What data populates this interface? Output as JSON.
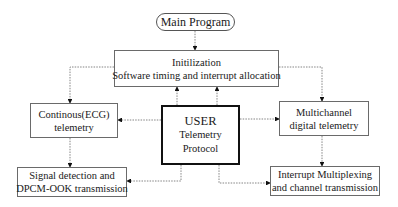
{
  "nodes": {
    "main": {
      "lines": [
        "Main Program"
      ]
    },
    "init": {
      "lines": [
        "Initilization",
        "Software timing and interrupt allocation"
      ]
    },
    "user": {
      "lines": [
        "USER",
        "Telemetry",
        "Protocol"
      ]
    },
    "ecg": {
      "lines": [
        "Continous(ECG)",
        "telemetry"
      ]
    },
    "multi": {
      "lines": [
        "Multichannel",
        "digital telemetry"
      ]
    },
    "signal": {
      "lines": [
        "Signal detection and",
        "DPCM-OOK transmission"
      ]
    },
    "interrupt": {
      "lines": [
        "Interrupt Multiplexing",
        "and channel transmission"
      ]
    }
  },
  "edges": [
    {
      "from": "main",
      "to": "init"
    },
    {
      "from": "init",
      "to": "ecg"
    },
    {
      "from": "init",
      "to": "multi"
    },
    {
      "from": "user",
      "to": "init"
    },
    {
      "from": "user",
      "to": "ecg"
    },
    {
      "from": "user",
      "to": "multi"
    },
    {
      "from": "ecg",
      "to": "signal"
    },
    {
      "from": "multi",
      "to": "interrupt"
    },
    {
      "from": "user",
      "to": "signal"
    },
    {
      "from": "user",
      "to": "interrupt"
    }
  ]
}
